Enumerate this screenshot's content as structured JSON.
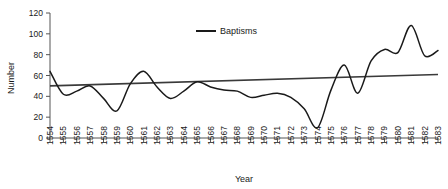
{
  "chart_data": {
    "type": "line",
    "title": "",
    "xlabel": "Year",
    "ylabel": "Number",
    "xlim": [
      1554,
      1583
    ],
    "ylim": [
      0,
      120
    ],
    "yticks": [
      0,
      20,
      40,
      60,
      80,
      100,
      120
    ],
    "grid": false,
    "legend_position": "top-center",
    "categories": [
      "1554",
      "1555",
      "1556",
      "1557",
      "1558",
      "1559",
      "1560",
      "1561",
      "1562",
      "1563",
      "1564",
      "1565",
      "1566",
      "1567",
      "1568",
      "1569",
      "1570",
      "1571",
      "1572",
      "1573",
      "1574",
      "1575",
      "1576",
      "1577",
      "1578",
      "1579",
      "1580",
      "1581",
      "1582",
      "1583"
    ],
    "series": [
      {
        "name": "Baptisms",
        "color": "#1a1a1a",
        "values": [
          64,
          42,
          45,
          50,
          38,
          26,
          52,
          64,
          49,
          38,
          45,
          54,
          49,
          46,
          45,
          39,
          41,
          43,
          39,
          28,
          10,
          46,
          70,
          43,
          74,
          85,
          82,
          108,
          79,
          84
        ]
      }
    ],
    "trendline": {
      "name": "linear-trend",
      "color": "#3a3a3a",
      "start_value": 50,
      "end_value": 61
    },
    "legend": [
      {
        "label": "Baptisms",
        "color": "#1a1a1a"
      }
    ]
  },
  "axes": {
    "y_title": "Number",
    "x_title": "Year"
  }
}
